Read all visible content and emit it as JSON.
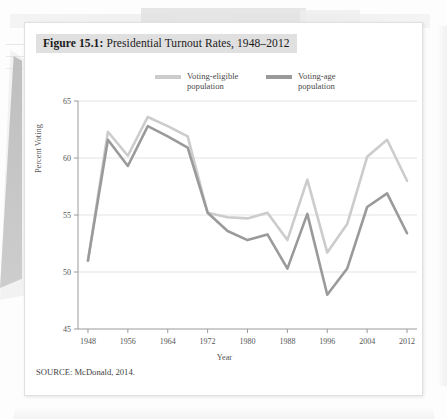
{
  "figure": {
    "number_label": "Figure 15.1:",
    "title": " Presidential Turnout Rates, 1948–2012",
    "source": "SOURCE: McDonald, 2014."
  },
  "legend": {
    "items": [
      {
        "label": "Voting-eligible\npopulation",
        "color": "#cccccc"
      },
      {
        "label": "Voting-age\npopulation",
        "color": "#9a9a9a"
      }
    ]
  },
  "chart_data": {
    "type": "line",
    "title": "Presidential Turnout Rates, 1948–2012",
    "xlabel": "Year",
    "ylabel": "Percent Voting",
    "x": [
      1948,
      1952,
      1956,
      1960,
      1964,
      1968,
      1972,
      1976,
      1980,
      1984,
      1988,
      1992,
      1996,
      2000,
      2004,
      2008,
      2012
    ],
    "xticks": [
      1948,
      1956,
      1964,
      1972,
      1980,
      1988,
      1996,
      2004,
      2012
    ],
    "yticks": [
      45,
      50,
      55,
      60,
      65
    ],
    "ylim": [
      45,
      65
    ],
    "xlim": [
      1946,
      2014
    ],
    "grid": "horizontal",
    "legend_position": "top-center",
    "series": [
      {
        "name": "Voting-eligible population",
        "color": "#cccccc",
        "values": [
          51.0,
          62.3,
          60.2,
          63.6,
          62.8,
          61.9,
          55.2,
          54.8,
          54.7,
          55.2,
          52.8,
          58.1,
          51.7,
          54.2,
          60.1,
          61.6,
          58.0
        ]
      },
      {
        "name": "Voting-age population",
        "color": "#9a9a9a",
        "values": [
          51.0,
          61.6,
          59.3,
          62.8,
          61.9,
          60.9,
          55.2,
          53.6,
          52.8,
          53.3,
          50.3,
          55.1,
          48.0,
          50.3,
          55.7,
          56.9,
          53.4
        ]
      }
    ]
  }
}
